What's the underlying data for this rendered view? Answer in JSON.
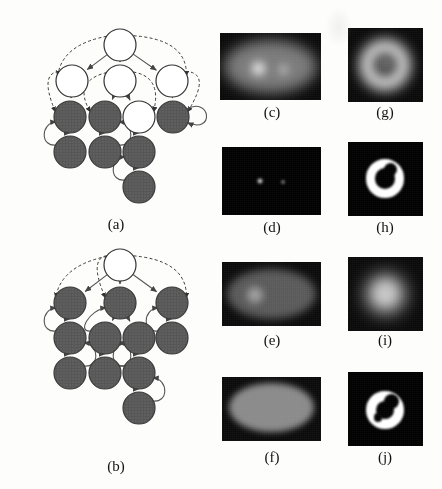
{
  "figure": {
    "type": "multi-panel-scientific-figure",
    "background_color": "#fdfdfc",
    "panel_count": 10
  },
  "captions": [
    {
      "id": "a",
      "label": "(a)",
      "x": 86,
      "y": 216
    },
    {
      "id": "b",
      "label": "(b)",
      "x": 86,
      "y": 458
    },
    {
      "id": "c",
      "label": "(c)",
      "x": 242,
      "y": 104
    },
    {
      "id": "d",
      "label": "(d)",
      "x": 242,
      "y": 219
    },
    {
      "id": "e",
      "label": "(e)",
      "x": 242,
      "y": 332
    },
    {
      "id": "f",
      "label": "(f)",
      "x": 242,
      "y": 449
    },
    {
      "id": "g",
      "label": "(g)",
      "x": 355,
      "y": 104
    },
    {
      "id": "h",
      "label": "(h)",
      "x": 355,
      "y": 219
    },
    {
      "id": "i",
      "label": "(i)",
      "x": 355,
      "y": 332
    },
    {
      "id": "j",
      "label": "(j)",
      "x": 355,
      "y": 449
    }
  ],
  "graphs": [
    {
      "id": "a",
      "name": "graph-a",
      "x": 0,
      "y": 10,
      "width": 215,
      "height": 200,
      "node_radius": 16,
      "colors": {
        "dark_fill": "#575757",
        "light_fill": "#ffffff",
        "stroke": "#333333",
        "edge": "#555555"
      },
      "nodes": [
        {
          "id": "a0",
          "x": 120,
          "y": 45,
          "fill": "light"
        },
        {
          "id": "a1",
          "x": 72,
          "y": 81,
          "fill": "light"
        },
        {
          "id": "a2",
          "x": 120,
          "y": 81,
          "fill": "light"
        },
        {
          "id": "a3",
          "x": 172,
          "y": 81,
          "fill": "light"
        },
        {
          "id": "a4",
          "x": 70,
          "y": 117,
          "fill": "dark"
        },
        {
          "id": "a5",
          "x": 105,
          "y": 117,
          "fill": "dark"
        },
        {
          "id": "a6",
          "x": 139,
          "y": 117,
          "fill": "light"
        },
        {
          "id": "a7",
          "x": 173,
          "y": 117,
          "fill": "dark"
        },
        {
          "id": "a8",
          "x": 70,
          "y": 152,
          "fill": "dark"
        },
        {
          "id": "a9",
          "x": 105,
          "y": 152,
          "fill": "dark"
        },
        {
          "id": "a10",
          "x": 139,
          "y": 152,
          "fill": "dark"
        },
        {
          "id": "a11",
          "x": 139,
          "y": 187,
          "fill": "dark"
        }
      ],
      "solid_edges": [
        [
          "a0",
          "a1"
        ],
        [
          "a0",
          "a2"
        ],
        [
          "a0",
          "a3"
        ],
        [
          "a1",
          "a4"
        ],
        [
          "a2",
          "a5"
        ],
        [
          "a2",
          "a6"
        ],
        [
          "a3",
          "a7"
        ],
        [
          "a4",
          "a8"
        ],
        [
          "a5",
          "a9"
        ],
        [
          "a6",
          "a10"
        ],
        [
          "a10",
          "a11"
        ]
      ],
      "dashed_edges": [
        [
          "a0",
          "a1"
        ],
        [
          "a0",
          "a3"
        ],
        [
          "a1",
          "a4"
        ],
        [
          "a2",
          "a5"
        ],
        [
          "a2",
          "a6"
        ],
        [
          "a3",
          "a7"
        ]
      ],
      "curved_back_edges": [
        [
          "a8",
          "a4"
        ],
        [
          "a9",
          "a5"
        ],
        [
          "a11",
          "a10"
        ],
        [
          "a7",
          "a7"
        ]
      ]
    },
    {
      "id": "b",
      "name": "graph-b",
      "x": 0,
      "y": 248,
      "width": 215,
      "height": 200,
      "node_radius": 16,
      "colors": {
        "dark_fill": "#575757",
        "light_fill": "#ffffff",
        "stroke": "#333333",
        "edge": "#555555"
      },
      "nodes": [
        {
          "id": "b0",
          "x": 120,
          "y": 265,
          "fill": "light"
        },
        {
          "id": "b1",
          "x": 70,
          "y": 303,
          "fill": "dark"
        },
        {
          "id": "b2",
          "x": 120,
          "y": 303,
          "fill": "dark"
        },
        {
          "id": "b3",
          "x": 172,
          "y": 303,
          "fill": "dark"
        },
        {
          "id": "b4",
          "x": 70,
          "y": 338,
          "fill": "dark"
        },
        {
          "id": "b5",
          "x": 105,
          "y": 338,
          "fill": "dark"
        },
        {
          "id": "b6",
          "x": 139,
          "y": 338,
          "fill": "dark"
        },
        {
          "id": "b7",
          "x": 172,
          "y": 338,
          "fill": "dark"
        },
        {
          "id": "b8",
          "x": 70,
          "y": 373,
          "fill": "dark"
        },
        {
          "id": "b9",
          "x": 105,
          "y": 373,
          "fill": "dark"
        },
        {
          "id": "b10",
          "x": 139,
          "y": 373,
          "fill": "dark"
        },
        {
          "id": "b11",
          "x": 139,
          "y": 408,
          "fill": "dark"
        }
      ],
      "solid_edges": [
        [
          "b0",
          "b1"
        ],
        [
          "b0",
          "b2"
        ],
        [
          "b0",
          "b3"
        ],
        [
          "b1",
          "b4"
        ],
        [
          "b2",
          "b5"
        ],
        [
          "b2",
          "b6"
        ],
        [
          "b3",
          "b7"
        ],
        [
          "b4",
          "b8"
        ],
        [
          "b5",
          "b9"
        ],
        [
          "b6",
          "b10"
        ],
        [
          "b10",
          "b11"
        ]
      ],
      "dashed_edges": [
        [
          "b0",
          "b1"
        ],
        [
          "b0",
          "b3"
        ],
        [
          "b0",
          "b2"
        ]
      ],
      "curved_back_edges": [
        [
          "b4",
          "b1"
        ],
        [
          "b8",
          "b4"
        ],
        [
          "b5",
          "b2"
        ],
        [
          "b9",
          "b5"
        ],
        [
          "b10",
          "b6"
        ],
        [
          "b11",
          "b10"
        ],
        [
          "b7",
          "b3"
        ]
      ]
    }
  ],
  "images": [
    {
      "id": "c",
      "name": "image-panel-c",
      "x": 220,
      "y": 33,
      "width": 101,
      "height": 67,
      "background": "#090909",
      "description": "soft grey ellipse on black with two bright blobs",
      "shapes": [
        {
          "kind": "ellipse",
          "cx": 50,
          "cy": 50,
          "rx": 46,
          "ry": 40,
          "color": "#8e8e8e",
          "blur": 7,
          "opacity": 0.85
        },
        {
          "kind": "blob",
          "cx": 38,
          "cy": 53,
          "r": 13,
          "color": "#ffffff",
          "blur": 5,
          "opacity": 1
        },
        {
          "kind": "blob",
          "cx": 63,
          "cy": 55,
          "r": 8,
          "color": "#e8e8e8",
          "blur": 5,
          "opacity": 0.9
        }
      ]
    },
    {
      "id": "d",
      "name": "image-panel-d",
      "x": 222,
      "y": 147,
      "width": 99,
      "height": 68,
      "background": "#000000",
      "description": "black field with two small bright points",
      "shapes": [
        {
          "kind": "blob",
          "cx": 38,
          "cy": 50,
          "r": 4.5,
          "color": "#ffffff",
          "blur": 1.5,
          "opacity": 1
        },
        {
          "kind": "blob",
          "cx": 62,
          "cy": 52,
          "r": 3,
          "color": "#e6e6e6",
          "blur": 1.5,
          "opacity": 0.95
        }
      ]
    },
    {
      "id": "e",
      "name": "image-panel-e",
      "x": 222,
      "y": 262,
      "width": 99,
      "height": 64,
      "background": "#0a0a0a",
      "description": "dim grey ellipse with a lighter circular region on the left",
      "shapes": [
        {
          "kind": "ellipse",
          "cx": 50,
          "cy": 50,
          "rx": 45,
          "ry": 39,
          "color": "#5f5f5f",
          "blur": 4,
          "opacity": 0.95
        },
        {
          "kind": "blob",
          "cx": 33,
          "cy": 52,
          "r": 17,
          "color": "#9d9d9d",
          "blur": 3,
          "opacity": 1
        }
      ]
    },
    {
      "id": "f",
      "name": "image-panel-f",
      "x": 222,
      "y": 377,
      "width": 99,
      "height": 64,
      "background": "#0a0a0a",
      "description": "uniform mid-grey ellipse on black",
      "shapes": [
        {
          "kind": "ellipse",
          "cx": 50,
          "cy": 48,
          "rx": 43,
          "ry": 38,
          "color": "#8a8a8a",
          "blur": 3,
          "opacity": 1
        }
      ]
    },
    {
      "id": "g",
      "name": "image-panel-g",
      "x": 348,
      "y": 28,
      "width": 75,
      "height": 74,
      "background": "#090909",
      "description": "bright fuzzy ring (donut) with dimmer centre",
      "shapes": [
        {
          "kind": "ring",
          "cx": 50,
          "cy": 50,
          "r_outer": 34,
          "r_inner": 16,
          "color": "#f2f2f2",
          "blur": 7,
          "opacity": 1
        },
        {
          "kind": "blob",
          "cx": 50,
          "cy": 48,
          "r": 13,
          "color": "#8d8d8d",
          "blur": 5,
          "opacity": 0.8
        }
      ]
    },
    {
      "id": "h",
      "name": "image-panel-h",
      "x": 348,
      "y": 142,
      "width": 75,
      "height": 74,
      "background": "#000000",
      "description": "hard-edged white C-shaped ring on black",
      "shapes": [
        {
          "kind": "ring",
          "cx": 50,
          "cy": 50,
          "r_outer": 27,
          "r_inner": 14,
          "color": "#ffffff",
          "blur": 1,
          "opacity": 1
        },
        {
          "kind": "notch",
          "cx": 57,
          "cy": 37,
          "r": 9,
          "color": "#000000",
          "blur": 1,
          "opacity": 1
        }
      ]
    },
    {
      "id": "i",
      "name": "image-panel-i",
      "x": 348,
      "y": 257,
      "width": 75,
      "height": 74,
      "background": "#090909",
      "description": "bright blurred blob, brighter at the rim",
      "shapes": [
        {
          "kind": "blob",
          "cx": 50,
          "cy": 50,
          "r": 33,
          "color": "#f4f4f4",
          "blur": 9,
          "opacity": 1
        },
        {
          "kind": "blob",
          "cx": 50,
          "cy": 46,
          "r": 15,
          "color": "#bdbdbd",
          "blur": 6,
          "opacity": 0.55
        }
      ]
    },
    {
      "id": "j",
      "name": "image-panel-j",
      "x": 348,
      "y": 372,
      "width": 75,
      "height": 74,
      "background": "#000000",
      "description": "irregular white ring with a dark wedge, on black",
      "shapes": [
        {
          "kind": "ring",
          "cx": 50,
          "cy": 52,
          "r_outer": 26,
          "r_inner": 12,
          "color": "#ffffff",
          "blur": 1,
          "opacity": 1
        },
        {
          "kind": "notch",
          "cx": 58,
          "cy": 40,
          "r": 10,
          "color": "#000000",
          "blur": 1,
          "opacity": 1
        },
        {
          "kind": "notch",
          "cx": 40,
          "cy": 62,
          "r": 6,
          "color": "#000000",
          "blur": 1,
          "opacity": 1
        }
      ]
    }
  ],
  "artifacts": [
    {
      "name": "scan-smudge",
      "x": 325,
      "y": 6,
      "width": 28,
      "height": 42
    }
  ]
}
